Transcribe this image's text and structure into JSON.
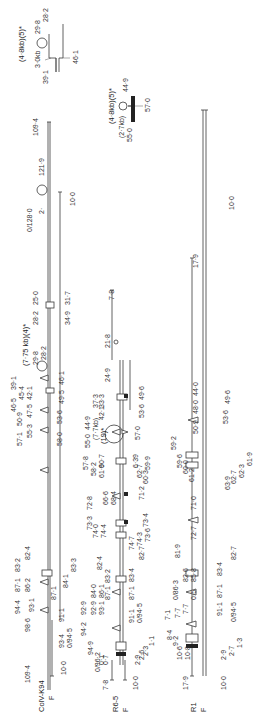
{
  "figure": {
    "maps": [
      {
        "name": "ColV-K94",
        "sub": "F",
        "labels": [
          "109·4",
          "98·6",
          "94·4",
          "93·1",
          "87·1",
          "86·2",
          "83·2",
          "82·4",
          "84·1",
          "83·3",
          "87·1",
          "91·1",
          "93·4",
          "0/94·5",
          "10·0",
          "57·1",
          "55·3",
          "58·0",
          "50·9",
          "47·5",
          "53·6",
          "46·5",
          "45·4",
          "42·1",
          "49·5",
          "39·1",
          "(7·75 kb)(4)*",
          "29·8",
          "28·2",
          "46·1",
          "28·2",
          "25·0",
          "34·9",
          "31·7",
          "0/128·0",
          "2·",
          "121·9",
          "10·0",
          "109·4"
        ]
      },
      {
        "name": "R6-5",
        "sub": "F",
        "labels": [
          "7·8",
          "10·0",
          "0/96·2",
          "94·9",
          "0·1",
          "0·7",
          "2·9",
          "2·6",
          "2·3",
          "1·1",
          "94·2",
          "92·9",
          "92·9",
          "93·1",
          "87·1",
          "84·0",
          "86·1",
          "83·2",
          "82·4",
          "91·1",
          "0/94·5",
          "87·1",
          "83·4",
          "82·7",
          "74·4",
          "74·0",
          "73·3",
          "72·8",
          "74·7",
          "74·3",
          "73·6",
          "73·4",
          "68·4",
          "66·6",
          "71·2",
          "61·9",
          "60·7",
          "58·2",
          "57·8",
          "55·0",
          "44·9",
          "(7·7kb)",
          "(19)*",
          "42·1",
          "37·3",
          "33·3",
          "57·0",
          "53·6",
          "49·6",
          "59·9",
          "60·3",
          "62·7",
          "6·39",
          "24·9",
          "21·8",
          "7·8"
        ]
      },
      {
        "name": "R1",
        "sub": "F",
        "labels": [
          "17·9",
          "10·8",
          "10·6",
          "9·2",
          "8·4",
          "7·1",
          "7·7",
          "7·7",
          "10·0",
          "2·9",
          "2·7",
          "1·3",
          "0/94·5",
          "91·1",
          "0·5",
          "0/86·3",
          "85·8",
          "82·6",
          "81·9",
          "87·1",
          "83·4",
          "82·7",
          "72·7",
          "71·0",
          "61·2",
          "60·0",
          "59·6",
          "59·2",
          "63·9",
          "62·7",
          "62·3",
          "61·9",
          "50·9",
          "48·0",
          "44·0",
          "53·6",
          "49·6",
          "17·9",
          "10·0"
        ]
      }
    ],
    "insets": [
      {
        "title": "(4·8kb)(5)*",
        "labels": [
          "3·0kb",
          "29·8",
          "28·2",
          "39·1",
          "46·1"
        ]
      },
      {
        "title": "(4·8kb)(5)*",
        "labels": [
          "(2·7kb)",
          "55·0",
          "44·9",
          "57·0"
        ]
      }
    ]
  }
}
